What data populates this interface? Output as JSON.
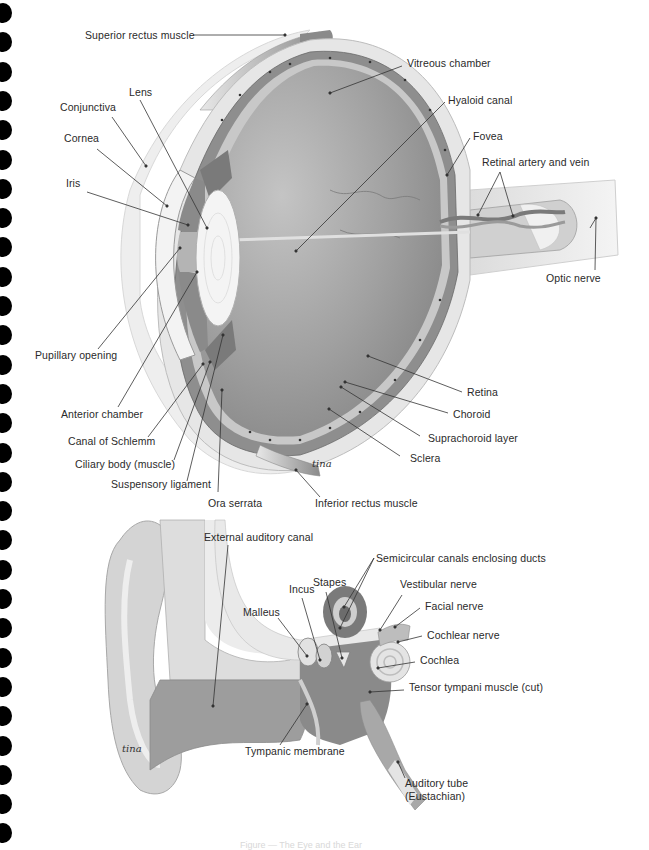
{
  "page": {
    "binding_holes": 29,
    "caption": "Figure — The Eye and the Ear"
  },
  "eye": {
    "title": "Eye cross-section",
    "labels": {
      "superior_rectus": "Superior rectus muscle",
      "lens": "Lens",
      "conjunctiva": "Conjunctiva",
      "cornea": "Cornea",
      "iris": "Iris",
      "vitreous": "Vitreous chamber",
      "hyaloid": "Hyaloid canal",
      "fovea": "Fovea",
      "retinal_av": "Retinal artery and vein",
      "optic_nerve": "Optic nerve",
      "pupillary": "Pupillary opening",
      "anterior": "Anterior chamber",
      "schlemm": "Canal of Schlemm",
      "ciliary": "Ciliary body (muscle)",
      "suspensory": "Suspensory ligament",
      "ora": "Ora serrata",
      "inferior_rectus": "Inferior rectus muscle",
      "retina": "Retina",
      "choroid": "Choroid",
      "suprachoroid": "Suprachoroid layer",
      "sclera": "Sclera"
    },
    "signature": "tina"
  },
  "ear": {
    "title": "Ear cross-section",
    "labels": {
      "external_canal": "External auditory canal",
      "semicircular": "Semicircular canals enclosing ducts",
      "incus": "Incus",
      "stapes": "Stapes",
      "vestibular": "Vestibular nerve",
      "malleus": "Malleus",
      "facial": "Facial nerve",
      "cochlear_nerve": "Cochlear nerve",
      "cochlea": "Cochlea",
      "tensor": "Tensor tympani muscle (cut)",
      "tympanic": "Tympanic membrane",
      "auditory_tube_1": "Auditory tube",
      "auditory_tube_2": "(Eustachian)"
    },
    "signature": "tina"
  },
  "colors": {
    "ink": "#2a2a2a",
    "vitreous": "#9a9a9a",
    "sclera": "#e4e4e4",
    "choroid": "#8c8c8c",
    "lens": "#f2f2f2",
    "ear_dark": "#8a8a8a",
    "ear_light": "#d6d6d6"
  }
}
